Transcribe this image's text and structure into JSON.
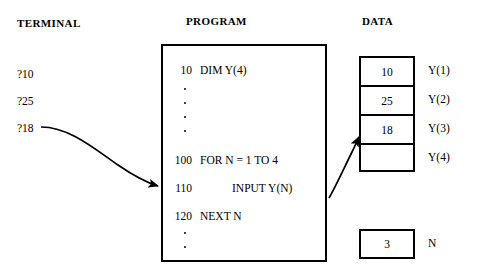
{
  "figure": {
    "headers": {
      "terminal": "TERMINAL",
      "program": "PROGRAM",
      "data": "DATA"
    },
    "terminal": {
      "lines": [
        {
          "text": "?10",
          "top": 68
        },
        {
          "text": "?25",
          "top": 95
        },
        {
          "text": "?18",
          "top": 122
        }
      ]
    },
    "program": {
      "statements": [
        {
          "number": "10",
          "code": "DIM  Y(4)",
          "top": 64,
          "indent": 0
        },
        {
          "number": "100",
          "code": "FOR  N = 1  TO  4",
          "top": 154,
          "indent": 0
        },
        {
          "number": "110",
          "code": "INPUT  Y(N)",
          "top": 182,
          "indent": 56
        },
        {
          "number": "120",
          "code": "NEXT  N",
          "top": 210,
          "indent": 0
        }
      ],
      "ellipsis_groups": [
        {
          "dots": [
            88,
            102,
            116,
            130
          ]
        },
        {
          "dots": [
            232,
            246
          ]
        }
      ]
    },
    "data": {
      "array_cells": [
        {
          "value": "10",
          "label": "Y(1)"
        },
        {
          "value": "25",
          "label": "Y(2)"
        },
        {
          "value": "18",
          "label": "Y(3)"
        },
        {
          "value": "",
          "label": "Y(4)"
        }
      ],
      "counter": {
        "value": "3",
        "label": "N"
      }
    },
    "arrows": [
      {
        "name": "terminal-to-input-statement",
        "from": "?18",
        "to": "110 INPUT Y(N)"
      },
      {
        "name": "input-statement-to-data-cell",
        "from": "110 INPUT Y(N)",
        "to": "Y(3)"
      }
    ],
    "colors": {
      "ink": "#000000",
      "background": "#ffffff"
    }
  }
}
